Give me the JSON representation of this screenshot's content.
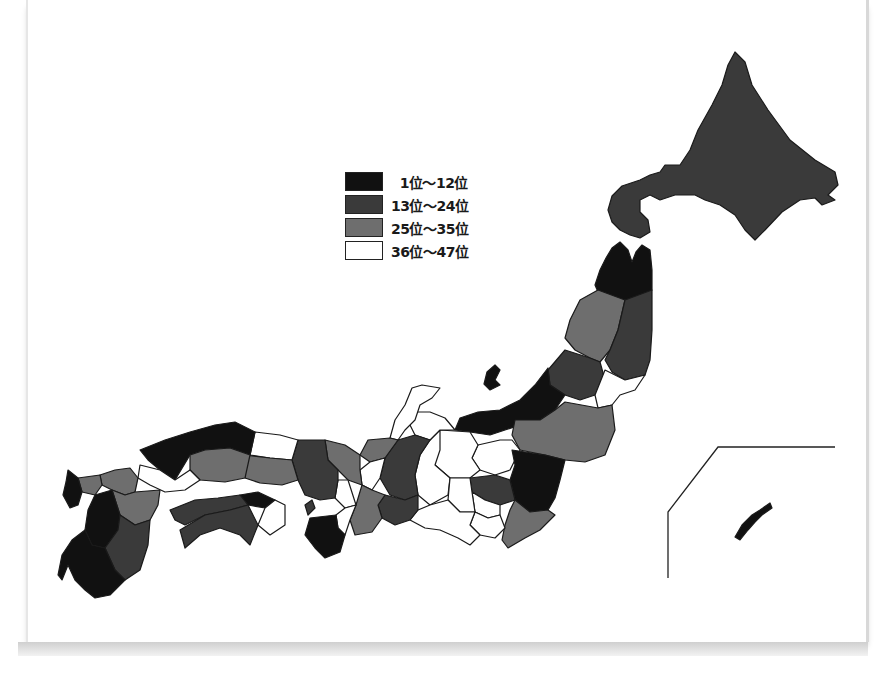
{
  "legend": {
    "items": [
      {
        "label": "  1位～12位",
        "color": "#111111"
      },
      {
        "label": "13位～24位",
        "color": "#3a3a3a"
      },
      {
        "label": "25位～35位",
        "color": "#6e6e6e"
      },
      {
        "label": "36位～47位",
        "color": "#ffffff"
      }
    ]
  },
  "map": {
    "title": "",
    "inset": "Okinawa",
    "class_colors": {
      "rank_1_12": "#111111",
      "rank_13_24": "#3a3a3a",
      "rank_25_35": "#6e6e6e",
      "rank_36_47": "#ffffff"
    }
  }
}
